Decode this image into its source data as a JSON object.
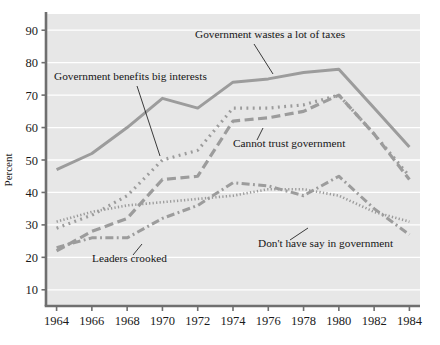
{
  "chart_data": {
    "type": "line",
    "title": "",
    "xlabel": "",
    "ylabel": "Percent",
    "x": [
      1964,
      1966,
      1968,
      1970,
      1972,
      1974,
      1976,
      1978,
      1980,
      1982,
      1984
    ],
    "xlim": [
      1963.4,
      1984.6
    ],
    "ylim": [
      5,
      95
    ],
    "yticks": [
      10,
      20,
      30,
      40,
      50,
      60,
      70,
      80,
      90
    ],
    "xticks": [
      "1964",
      "1966",
      "1968",
      "1970",
      "1972",
      "1974",
      "1976",
      "1978",
      "1980",
      "1982",
      "1984"
    ],
    "ytick_labels": [
      "10",
      "20",
      "30",
      "40",
      "50",
      "60",
      "70",
      "80",
      "90"
    ],
    "grid": "horizontal-white",
    "legend": "inline-annotations",
    "plot_bg": "#e7e7e7",
    "line_color": "#9c9c9c",
    "series": [
      {
        "name": "Government wastes a lot of taxes",
        "style": "solid",
        "values": [
          47,
          52,
          60,
          69,
          66,
          74,
          75,
          77,
          78,
          66,
          54
        ]
      },
      {
        "name": "Cannot trust government",
        "style": "long-dash",
        "values": [
          22,
          28,
          32,
          44,
          45,
          62,
          63,
          65,
          70,
          58,
          44
        ]
      },
      {
        "name": "Government benefits big interests",
        "style": "dotted",
        "values": [
          29,
          33,
          39,
          50,
          53,
          66,
          66,
          67,
          70,
          58,
          45
        ]
      },
      {
        "name": "Leaders crooked",
        "style": "dash-dot",
        "values": [
          23,
          26,
          26,
          32,
          36,
          43,
          42,
          39,
          45,
          35,
          27
        ]
      },
      {
        "name": "Don't have say in government",
        "style": "fine-dot",
        "values": [
          31,
          34,
          36,
          37,
          38,
          39,
          41,
          41,
          39,
          34,
          31
        ]
      }
    ],
    "annotations": [
      {
        "text": "Government wastes a lot of taxes",
        "anchor_year": 1972.2,
        "anchor_value": 66
      },
      {
        "text": "Government benefits big interests",
        "anchor_year": 1970.2,
        "anchor_value": 50
      },
      {
        "text": "Cannot trust government",
        "anchor_year": 1976.6,
        "anchor_value": 63
      },
      {
        "text": "Don't have say in government",
        "anchor_year": 1978.6,
        "anchor_value": 39
      },
      {
        "text": "Leaders crooked",
        "anchor_year": 1968.4,
        "anchor_value": 26
      }
    ]
  }
}
